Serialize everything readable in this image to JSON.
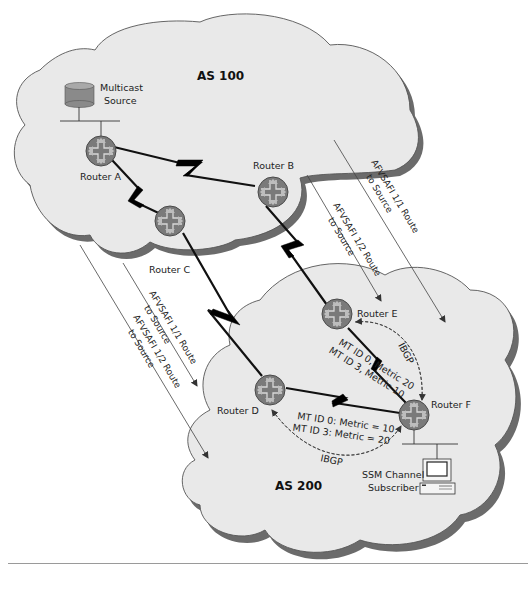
{
  "diagram": {
    "autonomous_systems": [
      {
        "id": "as100",
        "label": "AS 100"
      },
      {
        "id": "as200",
        "label": "AS 200"
      }
    ],
    "devices": {
      "multicast_source": {
        "line1": "Multicast",
        "line2": "Source"
      },
      "subscriber": {
        "line1": "SSM Channel",
        "line2": "Subscriber"
      }
    },
    "routers": {
      "a": {
        "label": "Router A"
      },
      "b": {
        "label": "Router B"
      },
      "c": {
        "label": "Router C"
      },
      "d": {
        "label": "Router D"
      },
      "e": {
        "label": "Router E"
      },
      "f": {
        "label": "Router F"
      }
    },
    "route_labels": {
      "b_to_f": {
        "line1": "AFVSAFI 1/1 Route",
        "line2": "to Source"
      },
      "b_to_e": {
        "line1": "AFVSAFI 1/2 Route",
        "line2": "to Source"
      },
      "c_to_d_11": {
        "line1": "AFVSAFI 1/1 Route",
        "line2": "to Source"
      },
      "c_to_d_12": {
        "line1": "AFVSAFI 1/2 Route",
        "line2": "to Source"
      }
    },
    "link_metrics": {
      "e_f": {
        "line1": "MT ID 0, Metric 20",
        "line2": "MT ID 3, Metric 10"
      },
      "d_f": {
        "line1": "MT ID 0: Metric = 10",
        "line2": "MT ID 3: Metric = 20"
      }
    },
    "sessions": {
      "e_f": "IBGP",
      "d_f": "IBGP"
    },
    "colors": {
      "cloud_fill": "#e9e9e9",
      "cloud_shadow": "#6b6b6b",
      "router_fill": "#7a7a7a",
      "database_fill": "#8a8a8a"
    }
  }
}
